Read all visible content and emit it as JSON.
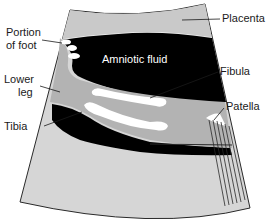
{
  "diagram": {
    "type": "ultrasound-schematic",
    "colors": {
      "fan_light": "#d6d6d6",
      "placenta": "#c9c9c9",
      "fluid": "#000000",
      "leg": "#b3b3b3",
      "bone": "#ffffff",
      "outline": "#2a2a2a"
    },
    "labels": {
      "placenta": "Placenta",
      "amniotic_fluid": "Amniotic fluid",
      "portion_of_foot_line1": "Portion",
      "portion_of_foot_line2": "of foot",
      "lower_leg_line1": "Lower",
      "lower_leg_line2": "leg",
      "fibula": "Fibula",
      "patella": "Patella",
      "tibia": "Tibia"
    }
  }
}
